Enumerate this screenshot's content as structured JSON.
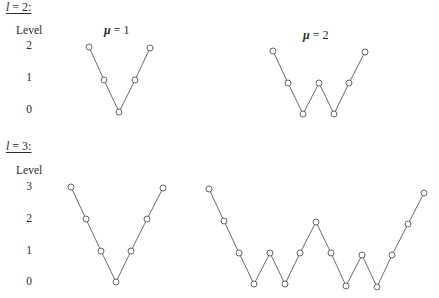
{
  "sections": [
    {
      "title": {
        "var": "l",
        "rest": " = 2:"
      },
      "level_header": "Level",
      "levels": [
        {
          "label": "2",
          "y": 46
        },
        {
          "label": "1",
          "y": 78
        },
        {
          "label": "0",
          "y": 110
        }
      ],
      "paths": [
        {
          "label": {
            "mu": "μ",
            "rest": " = 1"
          },
          "label_pos": [
            120,
            31
          ],
          "nodes": [
            [
              89,
              47
            ],
            [
              104,
              80
            ],
            [
              119,
              112
            ],
            [
              135,
              80
            ],
            [
              150,
              48
            ]
          ],
          "levels": [
            2,
            1,
            0,
            1,
            2
          ]
        },
        {
          "label": {
            "mu": "μ",
            "rest": " = 2"
          },
          "label_pos": [
            319,
            36
          ],
          "nodes": [
            [
              273,
              51
            ],
            [
              288,
              83
            ],
            [
              303,
              114
            ],
            [
              319,
              83
            ],
            [
              334,
              114
            ],
            [
              349,
              83
            ],
            [
              365,
              52
            ]
          ],
          "levels": [
            2,
            1,
            0,
            1,
            0,
            1,
            2
          ]
        }
      ]
    },
    {
      "title": {
        "var": "l",
        "rest": " = 3:"
      },
      "level_header": "Level",
      "levels": [
        {
          "label": "3",
          "y": 187
        },
        {
          "label": "2",
          "y": 219
        },
        {
          "label": "1",
          "y": 251
        },
        {
          "label": "0",
          "y": 282
        }
      ],
      "paths": [
        {
          "nodes": [
            [
              71,
              187
            ],
            [
              86,
              219
            ],
            [
              101,
              251
            ],
            [
              116,
              282
            ],
            [
              131,
              251
            ],
            [
              147,
              219
            ],
            [
              163,
              188
            ]
          ],
          "levels": [
            3,
            2,
            1,
            0,
            1,
            2,
            3
          ]
        },
        {
          "nodes": [
            [
              209,
              189
            ],
            [
              224,
              221
            ],
            [
              239,
              253
            ],
            [
              254,
              284
            ],
            [
              270,
              253
            ],
            [
              285,
              284
            ],
            [
              300,
              253
            ],
            [
              316,
              222
            ],
            [
              331,
              253
            ],
            [
              346,
              286
            ],
            [
              362,
              255
            ],
            [
              377,
              287
            ],
            [
              392,
              255
            ],
            [
              408,
              224
            ],
            [
              424,
              193
            ]
          ],
          "levels": [
            3,
            2,
            1,
            0,
            1,
            0,
            1,
            2,
            1,
            0,
            1,
            0,
            1,
            2,
            3
          ]
        }
      ]
    }
  ],
  "colors": {
    "edge": "#5a5a5a",
    "node_stroke": "#555555",
    "text": "#2a2a2a"
  }
}
